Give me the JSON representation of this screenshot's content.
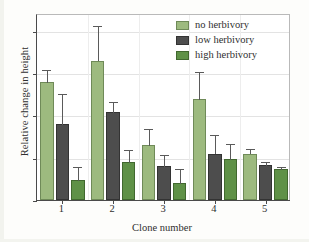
{
  "chart_data": {
    "type": "bar",
    "title": "",
    "xlabel": "Clone number",
    "ylabel": "Relative change in height",
    "categories": [
      "1",
      "2",
      "3",
      "4",
      "5"
    ],
    "ylim": [
      0.0,
      0.88
    ],
    "yticks": [
      "0.0",
      "0.2",
      "0.4",
      "0.6",
      "0.8"
    ],
    "ytick_values": [
      0.0,
      0.2,
      0.4,
      0.6,
      0.8
    ],
    "grid": true,
    "legend_position": "top-right",
    "series": [
      {
        "name": "no herbivory",
        "color": "#9dba7f",
        "values": [
          0.56,
          0.66,
          0.26,
          0.48,
          0.22
        ],
        "errors": [
          0.06,
          0.17,
          0.08,
          0.13,
          0.025
        ]
      },
      {
        "name": "low herbivory",
        "color": "#4d4d4d",
        "values": [
          0.36,
          0.415,
          0.16,
          0.22,
          0.165
        ],
        "errors": [
          0.145,
          0.055,
          0.06,
          0.09,
          0.02
        ]
      },
      {
        "name": "high herbivory",
        "color": "#5f9147",
        "values": [
          0.095,
          0.18,
          0.08,
          0.195,
          0.148
        ],
        "errors": [
          0.065,
          0.06,
          0.07,
          0.075,
          0.012
        ]
      }
    ]
  }
}
